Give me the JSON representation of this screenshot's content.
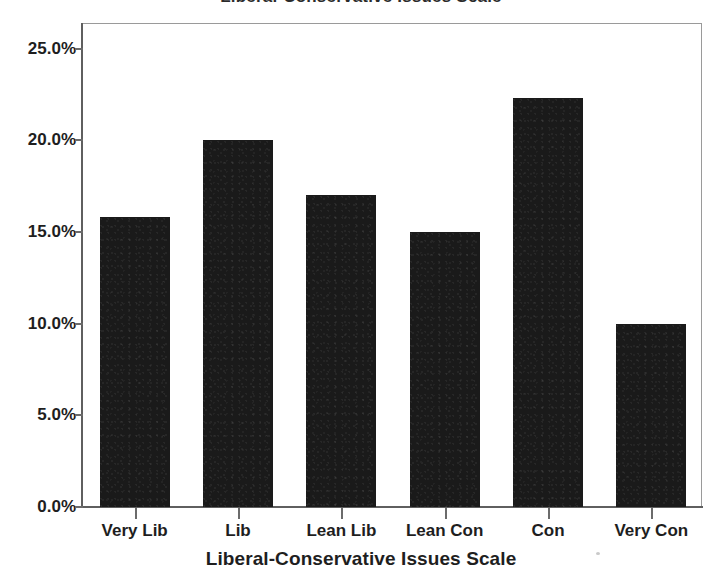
{
  "chart_data": {
    "type": "bar",
    "title": "",
    "xlabel": "Liberal-Conservative Issues Scale",
    "ylabel": "",
    "categories": [
      "Very Lib",
      "Lib",
      "Lean Lib",
      "Lean Con",
      "Con",
      "Very Con"
    ],
    "values": [
      15.8,
      20.0,
      17.0,
      15.0,
      22.3,
      10.0
    ],
    "value_labels": [
      "15.8%",
      "20.0%",
      "17.0%",
      "15.0%",
      "22.3%",
      "10.0%"
    ],
    "ylim": [
      0,
      26.4
    ],
    "ytick_values": [
      0.0,
      5.0,
      10.0,
      15.0,
      20.0,
      25.0
    ],
    "ytick_labels": [
      "0.0%",
      "5.0%",
      "10.0%",
      "15.0%",
      "20.0%",
      "25.0%"
    ],
    "grid": false,
    "legend": false,
    "legend_position": "none",
    "bar_color": "#1a1a1a",
    "axis_color": "#5f5f5f",
    "units": "percent"
  },
  "figure": {
    "title_cropped": "Liberal-Conservative Issues Scale",
    "axis_title": "Liberal-Conservative Issues Scale"
  }
}
